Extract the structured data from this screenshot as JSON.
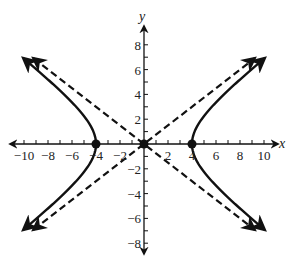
{
  "chart_data": {
    "type": "line",
    "title": "",
    "xlabel": "x",
    "ylabel": "y",
    "xlim": [
      -10,
      10
    ],
    "ylim": [
      -8,
      8
    ],
    "grid": false,
    "equation": "x^2/16 - y^2/9 = 1",
    "x_ticks": [
      -10,
      -9,
      -8,
      -7,
      -6,
      -5,
      -4,
      -3,
      -2,
      -1,
      1,
      2,
      3,
      4,
      5,
      6,
      7,
      8,
      9,
      10
    ],
    "x_tick_labels": [
      "-10",
      "-8",
      "-6",
      "-4",
      "-2",
      "2",
      "4",
      "6",
      "8",
      "10"
    ],
    "x_tick_label_values": [
      -10,
      -8,
      -6,
      -4,
      -2,
      2,
      4,
      6,
      8,
      10
    ],
    "y_ticks": [
      -8,
      -7,
      -6,
      -5,
      -4,
      -3,
      -2,
      -1,
      1,
      2,
      3,
      4,
      5,
      6,
      7,
      8
    ],
    "y_tick_labels": [
      "8",
      "6",
      "4",
      "2",
      "-2",
      "-4",
      "-6",
      "-8"
    ],
    "y_tick_label_values": [
      8,
      6,
      4,
      2,
      -2,
      -4,
      -6,
      -8
    ],
    "series": [
      {
        "name": "hyperbola right branch",
        "style": "solid",
        "a": 4,
        "b": 3,
        "branch": "right",
        "y_range": [
          -6.9,
          6.9
        ]
      },
      {
        "name": "hyperbola left branch",
        "style": "solid",
        "a": 4,
        "b": 3,
        "branch": "left",
        "y_range": [
          -6.9,
          6.9
        ]
      },
      {
        "name": "asymptote y = 3/4 x",
        "style": "dashed",
        "slope": 0.75,
        "x_range": [
          -9.2,
          9.2
        ]
      },
      {
        "name": "asymptote y = -3/4 x",
        "style": "dashed",
        "slope": -0.75,
        "x_range": [
          -9.2,
          9.2
        ]
      }
    ],
    "points": [
      {
        "label": "center",
        "x": 0,
        "y": 0
      },
      {
        "label": "vertex",
        "x": -4,
        "y": 0
      },
      {
        "label": "vertex",
        "x": 4,
        "y": 0
      }
    ]
  },
  "colors": {
    "ink": "#111111",
    "background": "#ffffff"
  }
}
